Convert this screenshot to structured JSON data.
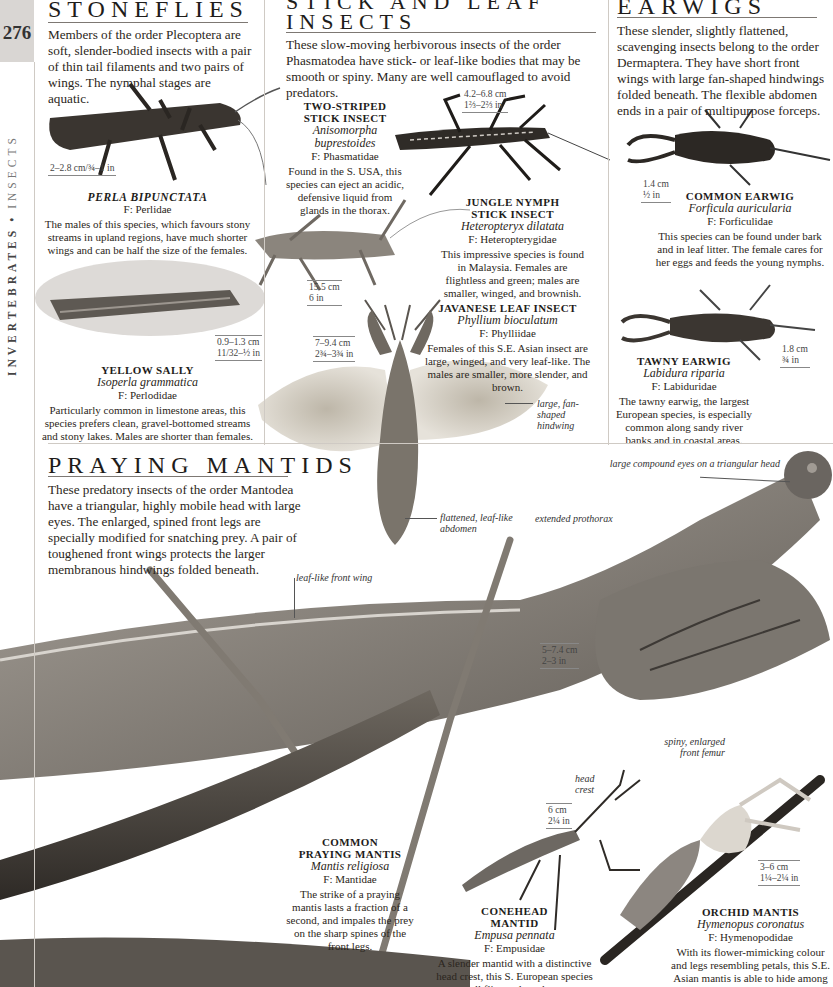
{
  "page": {
    "number": "276",
    "running_head_bold": "INVERTEBRATES",
    "running_head_separator": "•",
    "running_head_light": "INSECTS"
  },
  "stoneflies": {
    "title": "STONEFLIES",
    "intro": "Members of the order Plecoptera are soft, slender-bodied insects with a pair of thin tail filaments and two pairs of wings. The nymphal stages are aquatic.",
    "species": [
      {
        "common": "PERLA BIPUNCTATA",
        "scientific": "",
        "family": "F: Perlidae",
        "size": "2–2.8 cm/¾–1 in",
        "description": "The males of this species, which favours stony streams in upland regions, have much shorter wings and can be half the size of the females."
      },
      {
        "common": "YELLOW SALLY",
        "scientific": "Isoperla grammatica",
        "family": "F: Perlodidae",
        "size_cm": "0.9–1.3 cm",
        "size_in": "11/32–½ in",
        "description": "Particularly common in limestone areas, this species prefers clean, gravel-bottomed streams and stony lakes. Males are shorter than females."
      }
    ]
  },
  "stick": {
    "title_line1": "STICK AND LEAF",
    "title_line2": "INSECTS",
    "intro": "These slow-moving herbivorous insects of the order Phasmatodea have stick- or leaf-like bodies that may be smooth or spiny. Many are well camouflaged to avoid predators.",
    "species": [
      {
        "common_line1": "TWO-STRIPED",
        "common_line2": "STICK INSECT",
        "scientific": "Anisomorpha buprestoides",
        "family": "F: Phasmatidae",
        "size_cm": "4.2–6.8 cm",
        "size_in": "1⅔–2⅔ in",
        "description": "Found in the S. USA, this species can eject an acidic, defensive liquid from glands in the thorax."
      },
      {
        "common_line1": "JUNGLE NYMPH",
        "common_line2": "STICK INSECT",
        "scientific": "Heteropteryx dilatata",
        "family": "F: Heteropterygidae",
        "size_cm": "15.5 cm",
        "size_in": "6 in",
        "description": "This impressive species is found in Malaysia. Females are flightless and green; males are smaller, winged, and brownish."
      },
      {
        "common": "JAVANESE LEAF INSECT",
        "scientific": "Phyllium bioculatum",
        "family": "F: Phylliidae",
        "size_cm": "7–9.4 cm",
        "size_in": "2¾–3¾ in",
        "description": "Females of this S.E. Asian insect are large, winged, and very leaf-like. The males are smaller, more slender, and brown."
      }
    ],
    "labels": {
      "hindwing": "large, fan-shaped hindwing",
      "abdomen": "flattened, leaf-like abdomen"
    }
  },
  "earwigs": {
    "title": "EARWIGS",
    "intro": "These slender, slightly flattened, scavenging insects belong to the order Dermaptera. They have short front wings with large fan-shaped hindwings folded beneath. The flexible abdomen ends in a pair of multipurpose forceps.",
    "species": [
      {
        "common": "COMMON EARWIG",
        "scientific": "Forficula auricularia",
        "family": "F: Forficulidae",
        "size_cm": "1.4 cm",
        "size_in": "½ in",
        "description": "This species can be found under bark and in leaf litter. The female cares for her eggs and feeds the young nymphs."
      },
      {
        "common": "TAWNY EARWIG",
        "scientific": "Labidura riparia",
        "family": "F: Labiduridae",
        "size_cm": "1.8 cm",
        "size_in": "¾ in",
        "description": "The tawny earwig, the largest European species, is especially common along sandy river banks and in coastal areas."
      }
    ]
  },
  "mantids": {
    "title": "PRAYING MANTIDS",
    "intro": "These predatory insects of the order Mantodea have a triangular, highly mobile head with large eyes. The enlarged, spined front legs are specially modified for snatching prey. A pair of toughened front wings protects the larger membranous hindwings folded beneath.",
    "labels": {
      "eyes": "large compound eyes on a triangular head",
      "prothorax": "extended prothorax",
      "front_wing": "leaf-like front wing",
      "femur": "spiny, enlarged front femur",
      "head_crest_1": "head",
      "head_crest_2": "crest"
    },
    "common_size_cm": "5–7.4 cm",
    "common_size_in": "2–3 in",
    "species": [
      {
        "common_line1": "COMMON",
        "common_line2": "PRAYING MANTIS",
        "scientific": "Mantis religiosa",
        "family": "F: Mantidae",
        "description": "The strike of a praying mantis lasts a fraction of a second, and impales the prey on the sharp spines of the front legs."
      },
      {
        "common_line1": "CONEHEAD",
        "common_line2": "MANTID",
        "scientific": "Empusa pennata",
        "family": "F: Empusidae",
        "size_cm": "6 cm",
        "size_in": "2¼ in",
        "description": "A slender mantid with a distinctive head crest, this S. European species eats small flies and can be green or brown."
      },
      {
        "common": "ORCHID MANTIS",
        "scientific": "Hymenopus coronatus",
        "family": "F: Hymenopodidae",
        "size_cm": "3–6 cm",
        "size_in": "1¼–2¼ in",
        "description": "With its flower-mimicking colour and legs resembling petals, this S.E. Asian mantis is able to hide among foliage and ambush small insects."
      }
    ]
  }
}
